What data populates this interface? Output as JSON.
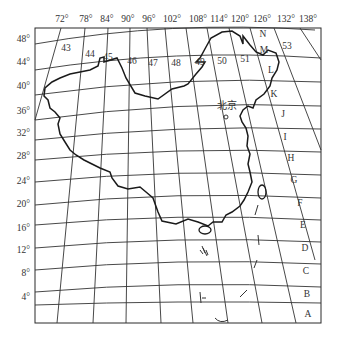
{
  "map": {
    "title": "",
    "longitude_labels": [
      "72°",
      "78°",
      "84°",
      "90°",
      "96°",
      "102°",
      "108°",
      "114°",
      "120°",
      "126°",
      "132°",
      "138°"
    ],
    "latitude_labels": [
      "48°",
      "44°",
      "40°",
      "36°",
      "32°",
      "28°",
      "24°",
      "20°",
      "16°",
      "12°",
      "8°",
      "4°"
    ],
    "zone_numbers": [
      "43",
      "44",
      "45",
      "46",
      "47",
      "48",
      "49",
      "50",
      "51",
      "53"
    ],
    "row_letters": [
      "N",
      "M",
      "L",
      "K",
      "J",
      "I",
      "H",
      "G",
      "F",
      "E",
      "D",
      "C",
      "B",
      "A"
    ],
    "city": {
      "name": "北京"
    },
    "colors": {
      "line": "#2a2a2a",
      "background": "#ffffff"
    }
  }
}
